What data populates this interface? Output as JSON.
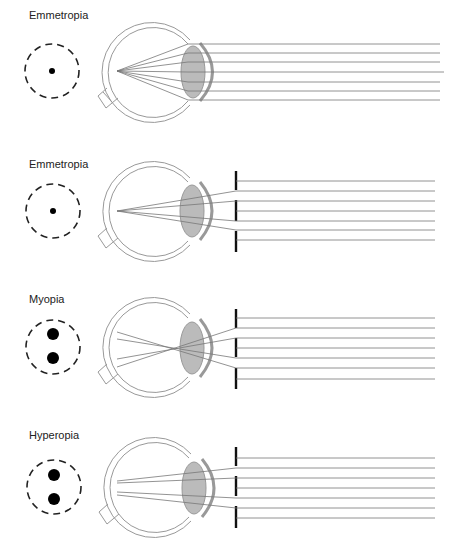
{
  "figure": {
    "panels": [
      {
        "id": "p1",
        "title": "Emmetropia",
        "top": 0,
        "barrier": false,
        "spot": "single",
        "focus": "retina"
      },
      {
        "id": "p2",
        "title": "Emmetropia",
        "top": 140,
        "barrier": true,
        "spot": "single",
        "focus": "retina"
      },
      {
        "id": "p3",
        "title": "Myopia",
        "top": 277,
        "barrier": true,
        "spot": "double",
        "focus": "in-front-of-retina"
      },
      {
        "id": "p4",
        "title": "Hyperopia",
        "top": 415,
        "barrier": true,
        "spot": "double",
        "focus": "behind-retina"
      }
    ],
    "colors": {
      "line": "#777777",
      "outline": "#999999",
      "barrier": "#111111",
      "dot": "#000000"
    }
  }
}
